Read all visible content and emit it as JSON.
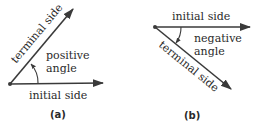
{
  "panels": [
    {
      "id": "a",
      "caption": "(a)",
      "initial_label": "initial side",
      "terminal_label": "terminal side",
      "angle_label_line1": "positive",
      "angle_label_line2": "angle",
      "angle_direction": "counterclockwise"
    },
    {
      "id": "b",
      "caption": "(b)",
      "initial_label": "initial side",
      "terminal_label": "terminal side",
      "angle_label_line1": "negative",
      "angle_label_line2": "angle",
      "angle_direction": "clockwise"
    }
  ],
  "colors": {
    "stroke": "#3a3a3a",
    "text": "#2a2a2a"
  }
}
